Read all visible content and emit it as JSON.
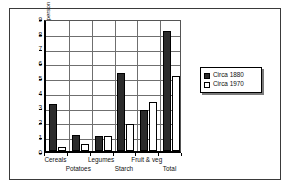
{
  "chart_data": {
    "type": "bar",
    "title": "",
    "xlabel": "",
    "ylabel": "Grams of fibre per person a day",
    "categories": [
      "Cereals",
      "Potatoes",
      "Legumes",
      "Starch",
      "Fruit & veg",
      "Total"
    ],
    "series": [
      {
        "name": "Circa 1880",
        "values": [
          3.2,
          1.1,
          1.0,
          5.3,
          2.8,
          8.1
        ],
        "color": "#2b2b2b",
        "pattern": "solid"
      },
      {
        "name": "Circa 1970",
        "values": [
          0.3,
          0.5,
          1.0,
          1.8,
          3.3,
          5.05
        ],
        "color": "#ffffff",
        "pattern": "dotted"
      }
    ],
    "ylim": [
      0,
      9
    ],
    "ytick_labels": [
      "0",
      "1",
      "2",
      "3",
      "4",
      "5",
      "6",
      "7",
      "8",
      "9"
    ],
    "grid": true,
    "legend_position": "right",
    "legend_entries": [
      "Circa 1880",
      "Circa 1970"
    ]
  },
  "legend": {
    "items": [
      {
        "label": "Circa 1880"
      },
      {
        "label": "Circa 1970"
      }
    ]
  },
  "axes": {
    "y_title": "Grams of fibre per person a day"
  }
}
